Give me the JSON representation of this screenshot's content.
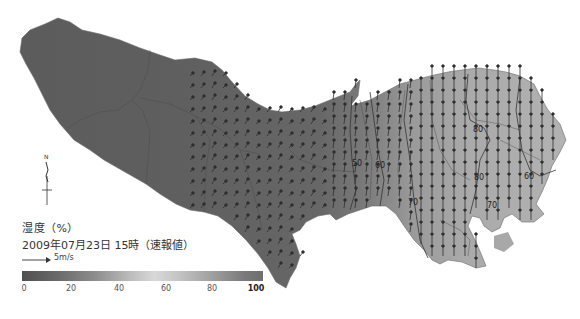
{
  "legend": {
    "title": "湿度（%）",
    "datetime": "2009年07月23日 15時（速報値）",
    "wind_scale_label": "5m/s",
    "colorbar_ticks": [
      "0",
      "20",
      "40",
      "60",
      "80",
      "100"
    ]
  },
  "compass": {
    "label": "N"
  },
  "contour_labels": [
    {
      "text": "50",
      "x": 356,
      "y": 166
    },
    {
      "text": "60",
      "x": 379,
      "y": 168
    },
    {
      "text": "70",
      "x": 412,
      "y": 205
    },
    {
      "text": "80",
      "x": 477,
      "y": 132
    },
    {
      "text": "80",
      "x": 478,
      "y": 180
    },
    {
      "text": "70",
      "x": 491,
      "y": 205
    },
    {
      "text": "60",
      "x": 528,
      "y": 177
    }
  ],
  "colors": {
    "west_shade": "#5e5e5e",
    "mid_shade": "#6e6e6e",
    "east_shade": "#a8a8a8",
    "far_east_shade": "#b4b4b4",
    "arrow": "#2e2e2e",
    "contour": "#333333"
  }
}
